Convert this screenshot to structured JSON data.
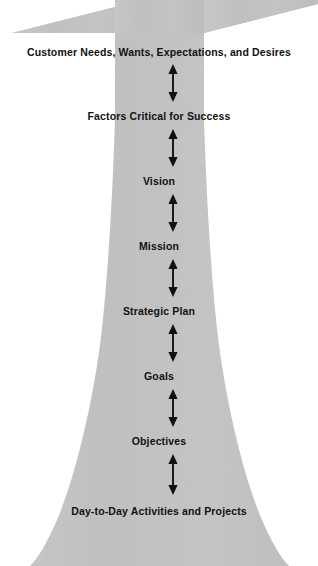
{
  "diagram": {
    "shape_color": "#c4c4c4",
    "text_color": "#111111",
    "arrow_color": "#111111",
    "background": "#ffffff",
    "levels": [
      {
        "label": "Customer Needs, Wants, Expectations, and Desires",
        "y": 46
      },
      {
        "label": "Factors Critical for Success",
        "y": 110
      },
      {
        "label": "Vision",
        "y": 175
      },
      {
        "label": "Mission",
        "y": 240
      },
      {
        "label": "Strategic Plan",
        "y": 305
      },
      {
        "label": "Goals",
        "y": 370
      },
      {
        "label": "Objectives",
        "y": 435
      },
      {
        "label": "Day-to-Day Activities and Projects",
        "y": 505
      }
    ],
    "connectors": [
      {
        "name": "connector-1",
        "from": "Customer Needs, Wants, Expectations, and Desires",
        "to": "Factors Critical for Success",
        "top": 64,
        "bottom": 101,
        "x": 173,
        "style": "double-headed-vertical-arrow"
      },
      {
        "name": "connector-2",
        "from": "Factors Critical for Success",
        "to": "Vision",
        "top": 129,
        "bottom": 166,
        "x": 173,
        "style": "double-headed-vertical-arrow"
      },
      {
        "name": "connector-3",
        "from": "Vision",
        "to": "Mission",
        "top": 194,
        "bottom": 231,
        "x": 173,
        "style": "double-headed-vertical-arrow"
      },
      {
        "name": "connector-4",
        "from": "Mission",
        "to": "Strategic Plan",
        "top": 259,
        "bottom": 296,
        "x": 173,
        "style": "double-headed-vertical-arrow"
      },
      {
        "name": "connector-5",
        "from": "Strategic Plan",
        "to": "Goals",
        "top": 324,
        "bottom": 361,
        "x": 173,
        "style": "double-headed-vertical-arrow"
      },
      {
        "name": "connector-6",
        "from": "Goals",
        "to": "Objectives",
        "top": 389,
        "bottom": 426,
        "x": 173,
        "style": "double-headed-vertical-arrow"
      },
      {
        "name": "connector-7",
        "from": "Objectives",
        "to": "Day-to-Day Activities and Projects",
        "top": 454,
        "bottom": 494,
        "x": 173,
        "style": "double-headed-vertical-arrow"
      }
    ]
  }
}
